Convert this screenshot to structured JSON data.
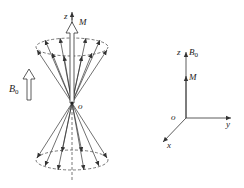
{
  "left_figure": {
    "axis_label": "z",
    "magnetization_label": "M",
    "field_label": "B",
    "field_subscript": "0",
    "origin_label": "o",
    "description": "Precessing nuclear spin vectors on double cone about z-axis"
  },
  "right_figure": {
    "z_label": "z",
    "field_label": "B",
    "field_subscript": "0",
    "magnetization_label": "M",
    "origin_label": "o",
    "y_label": "y",
    "x_label": "x"
  },
  "colors": {
    "line": "#333333",
    "dashed": "#555555",
    "text": "#222222",
    "background": "#ffffff"
  }
}
